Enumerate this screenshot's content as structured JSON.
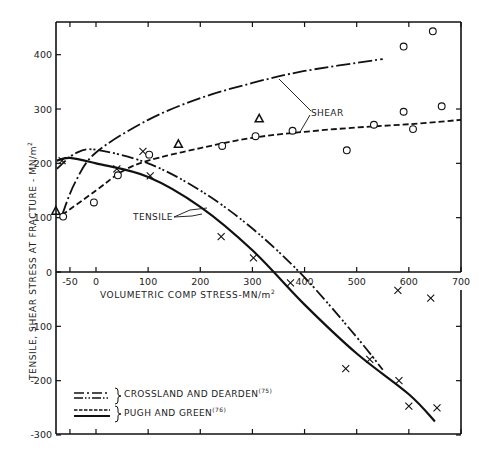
{
  "chart_data": {
    "type": "scatter",
    "title": "",
    "xlabel": "VOLUMETRIC COMP STRESS-MN/m²",
    "ylabel": "TENSILE, SHEAR STRESS AT FRACTURE - MN/m²",
    "xlim": [
      -80,
      700
    ],
    "ylim": [
      -300,
      460
    ],
    "x_ticks": [
      -50,
      0,
      100,
      200,
      300,
      400,
      500,
      600,
      700
    ],
    "y_ticks": [
      -300,
      -200,
      -100,
      0,
      100,
      200,
      300,
      400
    ],
    "grid": false,
    "annotations": [
      "SHEAR",
      "TENSILE"
    ],
    "legend": [
      {
        "label": "CROSSLAND AND DEARDEN",
        "ref": "(75)",
        "styles": [
          "dash-dot",
          "dash-dot-dot"
        ]
      },
      {
        "label": "PUGH AND GREEN",
        "ref": "(76)",
        "styles": [
          "dashed",
          "solid"
        ]
      }
    ],
    "series": [
      {
        "name": "Tensile data (x)",
        "marker": "cross",
        "points": [
          [
            -65,
            205
          ],
          [
            40,
            190
          ],
          [
            90,
            222
          ],
          [
            104,
            177
          ],
          [
            240,
            65
          ],
          [
            302,
            26
          ],
          [
            373,
            -20
          ],
          [
            479,
            -178
          ],
          [
            525,
            -161
          ],
          [
            579,
            -34
          ],
          [
            581,
            -200
          ],
          [
            600,
            -247
          ],
          [
            642,
            -48
          ],
          [
            654,
            -250
          ]
        ]
      },
      {
        "name": "Shear data (o)",
        "marker": "circle",
        "points": [
          [
            -63,
            102
          ],
          [
            -4,
            128
          ],
          [
            42,
            178
          ],
          [
            102,
            216
          ],
          [
            242,
            232
          ],
          [
            306,
            250
          ],
          [
            377,
            260
          ],
          [
            481,
            224
          ],
          [
            533,
            271
          ],
          [
            590,
            295
          ],
          [
            590,
            415
          ],
          [
            608,
            263
          ],
          [
            646,
            443
          ],
          [
            663,
            305
          ]
        ]
      },
      {
        "name": "Triangle data",
        "marker": "triangle",
        "points": [
          [
            -77,
            112
          ],
          [
            158,
            235
          ],
          [
            313,
            282
          ]
        ]
      },
      {
        "name": "Crossland and Dearden - Shear",
        "style": "dash-dot",
        "points": [
          [
            -65,
            105
          ],
          [
            -40,
            165
          ],
          [
            0,
            220
          ],
          [
            100,
            280
          ],
          [
            200,
            320
          ],
          [
            300,
            348
          ],
          [
            400,
            370
          ],
          [
            550,
            392
          ]
        ]
      },
      {
        "name": "Pugh and Green - Shear",
        "style": "dashed",
        "points": [
          [
            -65,
            105
          ],
          [
            0,
            150
          ],
          [
            50,
            185
          ],
          [
            100,
            205
          ],
          [
            200,
            228
          ],
          [
            300,
            247
          ],
          [
            400,
            258
          ],
          [
            500,
            266
          ],
          [
            600,
            272
          ],
          [
            700,
            280
          ]
        ]
      },
      {
        "name": "Crossland and Dearden - Tensile",
        "style": "dash-dot-dot",
        "points": [
          [
            -75,
            190
          ],
          [
            -40,
            218
          ],
          [
            0,
            225
          ],
          [
            100,
            200
          ],
          [
            200,
            150
          ],
          [
            300,
            80
          ],
          [
            400,
            -10
          ],
          [
            500,
            -120
          ],
          [
            550,
            -180
          ]
        ]
      },
      {
        "name": "Pugh and Green - Tensile",
        "style": "solid",
        "points": [
          [
            -75,
            205
          ],
          [
            -50,
            210
          ],
          [
            0,
            200
          ],
          [
            100,
            175
          ],
          [
            200,
            120
          ],
          [
            300,
            40
          ],
          [
            400,
            -60
          ],
          [
            500,
            -150
          ],
          [
            600,
            -225
          ],
          [
            650,
            -275
          ]
        ]
      }
    ]
  },
  "axes": {
    "x_tick_labels": [
      "-50",
      "0",
      "100",
      "200",
      "300",
      "400",
      "500",
      "600",
      "700"
    ],
    "y_tick_labels": [
      "400",
      "300",
      "200",
      "100",
      "0",
      "-100",
      "-200",
      "-300"
    ],
    "xlabel_main": "VOLUMETRIC COMP STRESS-MN/m",
    "xlabel_sup": "2",
    "ylabel_main": "TENSILE, SHEAR STRESS AT FRACTURE - MN/m",
    "ylabel_sup": "2"
  },
  "annotations": {
    "shear": "SHEAR",
    "tensile": "TENSILE"
  },
  "legend": {
    "item1_label": "CROSSLAND AND DEARDEN",
    "item1_ref": "(75)",
    "item2_label": "PUGH AND GREEN",
    "item2_ref": "(76)"
  }
}
